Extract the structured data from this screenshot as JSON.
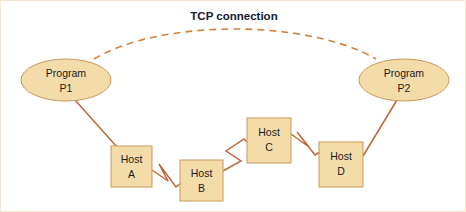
{
  "diagram": {
    "title": "TCP connection",
    "canvas": {
      "width": 466,
      "height": 212
    },
    "colors": {
      "node_fill": "#f4dcaa",
      "node_stroke": "#c89a5b",
      "link_line": "#c0663a",
      "dashed_arc": "#d2823f",
      "title_text": "#141b33",
      "label_text": "#1b1b1b",
      "background": "#ffffff",
      "frame": "#f2e6cf"
    },
    "programs": [
      {
        "id": "p1",
        "line1": "Program",
        "line2": "P1",
        "shape": "ellipse",
        "cx": 65,
        "cy": 79,
        "rx": 45,
        "ry": 21
      },
      {
        "id": "p2",
        "line1": "Program",
        "line2": "P2",
        "shape": "ellipse",
        "cx": 403,
        "cy": 79,
        "rx": 45,
        "ry": 21
      }
    ],
    "hosts": [
      {
        "id": "host-a",
        "line1": "Host",
        "line2": "A",
        "shape": "rect",
        "x": 110,
        "y": 145,
        "w": 41,
        "h": 41
      },
      {
        "id": "host-b",
        "line1": "Host",
        "line2": "B",
        "shape": "rect",
        "x": 179,
        "y": 159,
        "w": 43,
        "h": 41
      },
      {
        "id": "host-c",
        "line1": "Host",
        "line2": "C",
        "shape": "rect",
        "x": 246,
        "y": 117,
        "w": 44,
        "h": 45
      },
      {
        "id": "host-d",
        "line1": "Host",
        "line2": "D",
        "shape": "rect",
        "x": 318,
        "y": 141,
        "w": 44,
        "h": 45
      }
    ],
    "links": [
      {
        "id": "link-p1-hosta",
        "style": "solid",
        "from": "p1",
        "to": "host-a"
      },
      {
        "id": "link-hosta-hostb",
        "style": "zigzag",
        "from": "host-a",
        "to": "host-b"
      },
      {
        "id": "link-hostb-hostc",
        "style": "zigzag",
        "from": "host-b",
        "to": "host-c"
      },
      {
        "id": "link-hostc-hostd",
        "style": "zigzag",
        "from": "host-c",
        "to": "host-d"
      },
      {
        "id": "link-hostd-p2",
        "style": "solid",
        "from": "host-d",
        "to": "p2"
      },
      {
        "id": "link-tcp-arc",
        "style": "dashed-arc",
        "from": "p1",
        "to": "p2"
      }
    ],
    "title_position": {
      "x": 233,
      "y": 19
    }
  }
}
